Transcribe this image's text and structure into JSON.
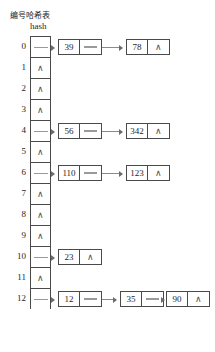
{
  "header": {
    "index_label": "编号",
    "hash_label_cn": "哈希表",
    "hash_label_en": "hash"
  },
  "symbols": {
    "null_marker": "∧"
  },
  "colors": {
    "background": "#ffffff",
    "border": "#4a4a4a",
    "text": "#262626",
    "arrow": "#8a8a8a"
  },
  "table": {
    "bucket_count": 13,
    "buckets": [
      {
        "index": "0",
        "empty": false,
        "nodes": [
          {
            "key": "39",
            "next": "link"
          },
          {
            "key": "78",
            "next": "null"
          }
        ]
      },
      {
        "index": "1",
        "empty": true,
        "nodes": []
      },
      {
        "index": "2",
        "empty": true,
        "nodes": []
      },
      {
        "index": "3",
        "empty": true,
        "nodes": []
      },
      {
        "index": "4",
        "empty": false,
        "nodes": [
          {
            "key": "56",
            "next": "link"
          },
          {
            "key": "342",
            "next": "null"
          }
        ]
      },
      {
        "index": "5",
        "empty": true,
        "nodes": []
      },
      {
        "index": "6",
        "empty": false,
        "nodes": [
          {
            "key": "110",
            "next": "link"
          },
          {
            "key": "123",
            "next": "null"
          }
        ]
      },
      {
        "index": "7",
        "empty": true,
        "nodes": []
      },
      {
        "index": "8",
        "empty": true,
        "nodes": []
      },
      {
        "index": "9",
        "empty": true,
        "nodes": []
      },
      {
        "index": "10",
        "empty": false,
        "nodes": [
          {
            "key": "23",
            "next": "null"
          }
        ]
      },
      {
        "index": "11",
        "empty": true,
        "nodes": []
      },
      {
        "index": "12",
        "empty": false,
        "nodes": [
          {
            "key": "12",
            "next": "link"
          },
          {
            "key": "35",
            "next": "link"
          },
          {
            "key": "90",
            "next": "null"
          }
        ]
      }
    ]
  }
}
